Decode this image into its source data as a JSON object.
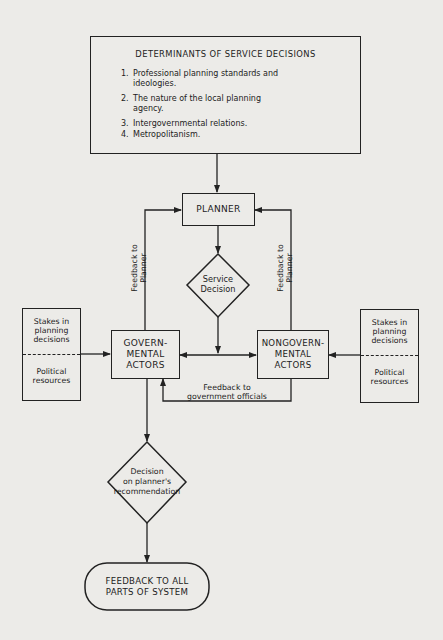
{
  "determinants": {
    "title": "DETERMINANTS OF SERVICE DECISIONS",
    "items": [
      {
        "num": "1.",
        "text": "Professional planning standards and ideologies."
      },
      {
        "num": "2.",
        "text": "The nature of the local planning agency."
      },
      {
        "num": "3.",
        "text": "Intergovernmental relations."
      },
      {
        "num": "4.",
        "text": "Metropolitanism."
      }
    ]
  },
  "nodes": {
    "planner": "PLANNER",
    "service_decision": "Service Decision",
    "governmental": "GOVERN- MENTAL ACTORS",
    "governmental_lines": [
      "GOVERN-",
      "MENTAL",
      "ACTORS"
    ],
    "nongovernmental_lines": [
      "NONGOVERN-",
      "MENTAL",
      "ACTORS"
    ],
    "decision_lines": [
      "Decision",
      "on planner's",
      "recommendation"
    ],
    "feedback_all_lines": [
      "FEEDBACK TO ALL",
      "PARTS OF SYSTEM"
    ]
  },
  "stakes_left": {
    "top_lines": [
      "Stakes in",
      "planning",
      "decisions"
    ],
    "bottom_lines": [
      "Political",
      "resources"
    ]
  },
  "stakes_right": {
    "top_lines": [
      "Stakes in",
      "planning",
      "decisions"
    ],
    "bottom_lines": [
      "Political",
      "resources"
    ]
  },
  "edge_labels": {
    "feedback_left": [
      "Feedback to",
      "Planner"
    ],
    "feedback_right": [
      "Feedback to",
      "Planner"
    ],
    "feedback_gov": [
      "Feedback to",
      "government officials"
    ]
  },
  "colors": {
    "background": "#ecebe8",
    "ink": "#1c1c1c"
  }
}
